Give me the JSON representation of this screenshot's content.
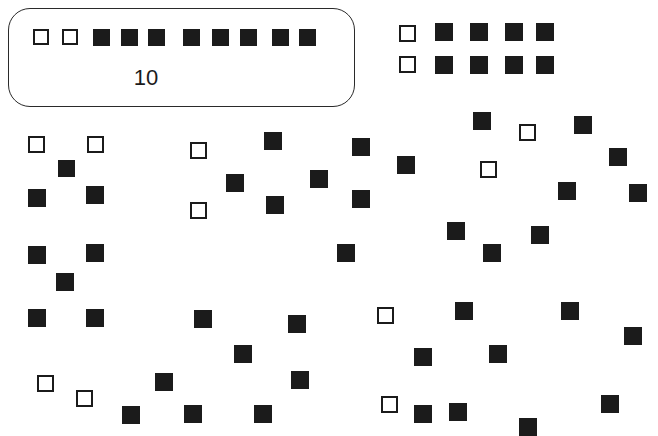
{
  "figure": {
    "type": "scatter-symbol-diagram",
    "background_color": "#ffffff",
    "filled_color": "#1b1b1b",
    "open_fill_color": "#ffffff",
    "open_stroke_color": "#1b1b1b",
    "width": 658,
    "height": 436
  },
  "legend": {
    "name": "scale-legend",
    "label": "10",
    "box": {
      "x": 8,
      "y": 8,
      "width": 347,
      "height": 99,
      "radius": 22,
      "stroke": "#2a2a2a"
    },
    "label_position": {
      "x": 146,
      "y": 78
    },
    "squares": [
      {
        "x": 33,
        "y": 29,
        "size": 16,
        "type": "open"
      },
      {
        "x": 62,
        "y": 29,
        "size": 16,
        "type": "open"
      },
      {
        "x": 93,
        "y": 29,
        "size": 17,
        "type": "filled"
      },
      {
        "x": 121,
        "y": 29,
        "size": 17,
        "type": "filled"
      },
      {
        "x": 148,
        "y": 29,
        "size": 17,
        "type": "filled"
      },
      {
        "x": 183,
        "y": 29,
        "size": 17,
        "type": "filled"
      },
      {
        "x": 212,
        "y": 29,
        "size": 17,
        "type": "filled"
      },
      {
        "x": 240,
        "y": 29,
        "size": 17,
        "type": "filled"
      },
      {
        "x": 272,
        "y": 29,
        "size": 17,
        "type": "filled"
      },
      {
        "x": 299,
        "y": 29,
        "size": 17,
        "type": "filled"
      }
    ],
    "counts": {
      "open": 2,
      "filled": 8,
      "total": 10
    }
  },
  "cluster_top_right": {
    "name": "top-right-grid",
    "rows": 2,
    "columns": 5,
    "squares": [
      {
        "x": 399,
        "y": 25,
        "size": 17,
        "type": "open"
      },
      {
        "x": 435,
        "y": 23,
        "size": 18,
        "type": "filled"
      },
      {
        "x": 470,
        "y": 23,
        "size": 18,
        "type": "filled"
      },
      {
        "x": 505,
        "y": 23,
        "size": 18,
        "type": "filled"
      },
      {
        "x": 536,
        "y": 23,
        "size": 18,
        "type": "filled"
      },
      {
        "x": 399,
        "y": 56,
        "size": 17,
        "type": "open"
      },
      {
        "x": 435,
        "y": 56,
        "size": 18,
        "type": "filled"
      },
      {
        "x": 470,
        "y": 56,
        "size": 18,
        "type": "filled"
      },
      {
        "x": 505,
        "y": 56,
        "size": 18,
        "type": "filled"
      },
      {
        "x": 536,
        "y": 56,
        "size": 18,
        "type": "filled"
      }
    ],
    "counts": {
      "open": 2,
      "filled": 8,
      "total": 10
    }
  },
  "scatter": {
    "name": "scatter-field",
    "counts": {
      "open": 11,
      "filled": 52,
      "total": 63
    },
    "squares": [
      {
        "x": 28,
        "y": 136,
        "size": 17,
        "type": "open"
      },
      {
        "x": 87,
        "y": 136,
        "size": 17,
        "type": "open"
      },
      {
        "x": 190,
        "y": 142,
        "size": 17,
        "type": "open"
      },
      {
        "x": 58,
        "y": 160,
        "size": 17,
        "type": "filled"
      },
      {
        "x": 264,
        "y": 132,
        "size": 18,
        "type": "filled"
      },
      {
        "x": 352,
        "y": 138,
        "size": 18,
        "type": "filled"
      },
      {
        "x": 473,
        "y": 112,
        "size": 18,
        "type": "filled"
      },
      {
        "x": 519,
        "y": 124,
        "size": 17,
        "type": "open"
      },
      {
        "x": 574,
        "y": 116,
        "size": 18,
        "type": "filled"
      },
      {
        "x": 28,
        "y": 189,
        "size": 18,
        "type": "filled"
      },
      {
        "x": 86,
        "y": 186,
        "size": 18,
        "type": "filled"
      },
      {
        "x": 226,
        "y": 174,
        "size": 18,
        "type": "filled"
      },
      {
        "x": 190,
        "y": 202,
        "size": 17,
        "type": "open"
      },
      {
        "x": 266,
        "y": 196,
        "size": 18,
        "type": "filled"
      },
      {
        "x": 310,
        "y": 170,
        "size": 18,
        "type": "filled"
      },
      {
        "x": 397,
        "y": 156,
        "size": 18,
        "type": "filled"
      },
      {
        "x": 480,
        "y": 161,
        "size": 17,
        "type": "open"
      },
      {
        "x": 609,
        "y": 148,
        "size": 18,
        "type": "filled"
      },
      {
        "x": 352,
        "y": 190,
        "size": 18,
        "type": "filled"
      },
      {
        "x": 558,
        "y": 182,
        "size": 18,
        "type": "filled"
      },
      {
        "x": 629,
        "y": 184,
        "size": 18,
        "type": "filled"
      },
      {
        "x": 28,
        "y": 246,
        "size": 18,
        "type": "filled"
      },
      {
        "x": 86,
        "y": 244,
        "size": 18,
        "type": "filled"
      },
      {
        "x": 56,
        "y": 273,
        "size": 18,
        "type": "filled"
      },
      {
        "x": 337,
        "y": 244,
        "size": 18,
        "type": "filled"
      },
      {
        "x": 447,
        "y": 222,
        "size": 18,
        "type": "filled"
      },
      {
        "x": 531,
        "y": 226,
        "size": 18,
        "type": "filled"
      },
      {
        "x": 483,
        "y": 244,
        "size": 18,
        "type": "filled"
      },
      {
        "x": 28,
        "y": 309,
        "size": 18,
        "type": "filled"
      },
      {
        "x": 86,
        "y": 309,
        "size": 18,
        "type": "filled"
      },
      {
        "x": 194,
        "y": 310,
        "size": 18,
        "type": "filled"
      },
      {
        "x": 288,
        "y": 315,
        "size": 18,
        "type": "filled"
      },
      {
        "x": 377,
        "y": 307,
        "size": 17,
        "type": "open"
      },
      {
        "x": 455,
        "y": 302,
        "size": 18,
        "type": "filled"
      },
      {
        "x": 561,
        "y": 302,
        "size": 18,
        "type": "filled"
      },
      {
        "x": 624,
        "y": 327,
        "size": 18,
        "type": "filled"
      },
      {
        "x": 234,
        "y": 345,
        "size": 18,
        "type": "filled"
      },
      {
        "x": 291,
        "y": 371,
        "size": 18,
        "type": "filled"
      },
      {
        "x": 414,
        "y": 348,
        "size": 18,
        "type": "filled"
      },
      {
        "x": 489,
        "y": 345,
        "size": 18,
        "type": "filled"
      },
      {
        "x": 37,
        "y": 375,
        "size": 17,
        "type": "open"
      },
      {
        "x": 155,
        "y": 373,
        "size": 18,
        "type": "filled"
      },
      {
        "x": 76,
        "y": 390,
        "size": 17,
        "type": "open"
      },
      {
        "x": 381,
        "y": 396,
        "size": 17,
        "type": "open"
      },
      {
        "x": 601,
        "y": 395,
        "size": 18,
        "type": "filled"
      },
      {
        "x": 122,
        "y": 406,
        "size": 18,
        "type": "filled"
      },
      {
        "x": 184,
        "y": 405,
        "size": 18,
        "type": "filled"
      },
      {
        "x": 254,
        "y": 405,
        "size": 18,
        "type": "filled"
      },
      {
        "x": 414,
        "y": 405,
        "size": 18,
        "type": "filled"
      },
      {
        "x": 449,
        "y": 403,
        "size": 18,
        "type": "filled"
      },
      {
        "x": 519,
        "y": 418,
        "size": 18,
        "type": "filled"
      }
    ]
  }
}
